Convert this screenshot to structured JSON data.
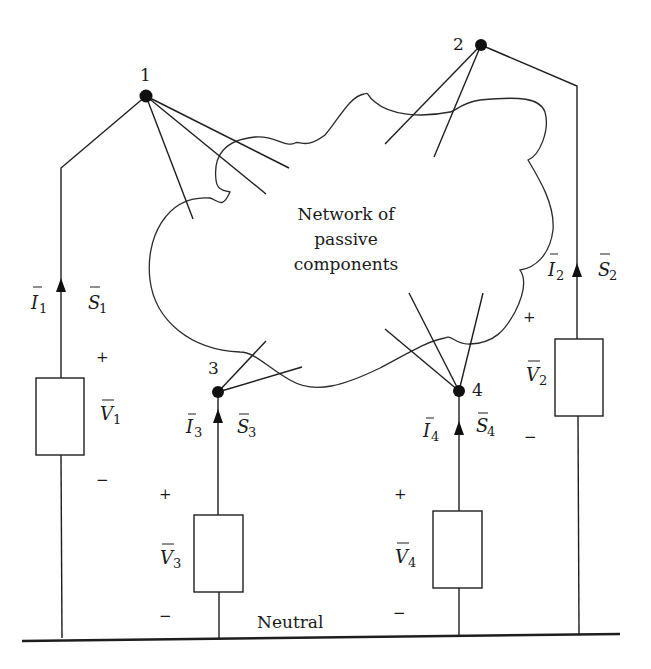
{
  "diagram": {
    "cloud": {
      "label_lines": [
        "Network of",
        "passive",
        "components"
      ]
    },
    "nodes": [
      {
        "id": "1",
        "label": "1"
      },
      {
        "id": "2",
        "label": "2"
      },
      {
        "id": "3",
        "label": "3"
      },
      {
        "id": "4",
        "label": "4"
      }
    ],
    "branches": [
      {
        "bus": "1",
        "current": {
          "sym": "I",
          "sub": "1"
        },
        "power": {
          "sym": "S",
          "sub": "1"
        },
        "voltage": {
          "sym": "V",
          "sub": "1"
        },
        "plus": "+",
        "minus": "−"
      },
      {
        "bus": "2",
        "current": {
          "sym": "I",
          "sub": "2"
        },
        "power": {
          "sym": "S",
          "sub": "2"
        },
        "voltage": {
          "sym": "V",
          "sub": "2"
        },
        "plus": "+",
        "minus": "−"
      },
      {
        "bus": "3",
        "current": {
          "sym": "I",
          "sub": "3"
        },
        "power": {
          "sym": "S",
          "sub": "3"
        },
        "voltage": {
          "sym": "V",
          "sub": "3"
        },
        "plus": "+",
        "minus": "−"
      },
      {
        "bus": "4",
        "current": {
          "sym": "I",
          "sub": "4"
        },
        "power": {
          "sym": "S",
          "sub": "4"
        },
        "voltage": {
          "sym": "V",
          "sub": "4"
        },
        "plus": "+",
        "minus": "−"
      }
    ],
    "neutral_label": "Neutral",
    "colors": {
      "ink": "#1e1e1e",
      "background": "#ffffff"
    }
  }
}
